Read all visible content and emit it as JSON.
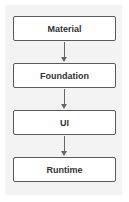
{
  "diagram": {
    "type": "layered-stack",
    "nodes": [
      {
        "id": "material",
        "label": "Material"
      },
      {
        "id": "foundation",
        "label": "Foundation"
      },
      {
        "id": "ui",
        "label": "UI"
      },
      {
        "id": "runtime",
        "label": "Runtime"
      }
    ],
    "edges": [
      {
        "from": "material",
        "to": "foundation"
      },
      {
        "from": "foundation",
        "to": "ui"
      },
      {
        "from": "ui",
        "to": "runtime"
      }
    ],
    "colors": {
      "background": "#f3f3f3",
      "box_border": "#5a5a5a",
      "arrow": "#666666",
      "text": "#333333"
    }
  }
}
